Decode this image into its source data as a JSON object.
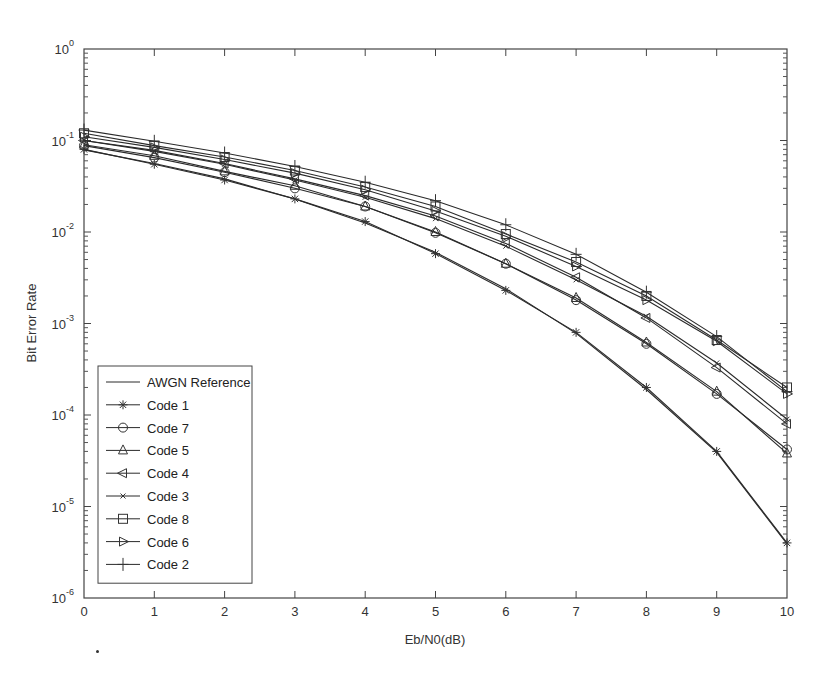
{
  "chart_data": {
    "type": "line",
    "title": "",
    "xlabel": "Eb/N0(dB)",
    "ylabel": "Bit Error Rate",
    "xlim": [
      0,
      10
    ],
    "ylim": [
      1e-06,
      1
    ],
    "yscale": "log",
    "grid": false,
    "legend_position": "lower left",
    "x_ticks": [
      "0",
      "1",
      "2",
      "3",
      "4",
      "5",
      "6",
      "7",
      "8",
      "9",
      "10"
    ],
    "y_ticks": [
      {
        "base": "10",
        "exp": "0"
      },
      {
        "base": "10",
        "exp": "-1"
      },
      {
        "base": "10",
        "exp": "-2"
      },
      {
        "base": "10",
        "exp": "-3"
      },
      {
        "base": "10",
        "exp": "-4"
      },
      {
        "base": "10",
        "exp": "-5"
      },
      {
        "base": "10",
        "exp": "-6"
      }
    ],
    "x": [
      0,
      1,
      2,
      3,
      4,
      5,
      6,
      7,
      8,
      9,
      10
    ],
    "series": [
      {
        "name": "AWGN Reference",
        "marker": "none",
        "values": [
          0.079,
          0.056,
          0.038,
          0.023,
          0.0125,
          0.006,
          0.0024,
          0.00078,
          0.00019,
          3.9e-05,
          3.9e-06
        ]
      },
      {
        "name": "Code 1",
        "marker": "asterisk",
        "values": [
          0.08,
          0.055,
          0.037,
          0.023,
          0.013,
          0.0058,
          0.0023,
          0.0008,
          0.0002,
          4e-05,
          4e-06
        ]
      },
      {
        "name": "Code 7",
        "marker": "circle",
        "values": [
          0.088,
          0.065,
          0.045,
          0.03,
          0.019,
          0.0098,
          0.0045,
          0.0018,
          0.0006,
          0.00017,
          4.2e-05
        ]
      },
      {
        "name": "Code 5",
        "marker": "triangle-up",
        "values": [
          0.09,
          0.068,
          0.046,
          0.032,
          0.019,
          0.01,
          0.0045,
          0.0019,
          0.00062,
          0.00018,
          3.8e-05
        ]
      },
      {
        "name": "Code 4",
        "marker": "triangle-left",
        "values": [
          0.1,
          0.078,
          0.056,
          0.038,
          0.025,
          0.015,
          0.0075,
          0.0032,
          0.00115,
          0.00033,
          8e-05
        ]
      },
      {
        "name": "Code 3",
        "marker": "x-small",
        "values": [
          0.1,
          0.076,
          0.055,
          0.037,
          0.024,
          0.014,
          0.007,
          0.003,
          0.0012,
          0.00037,
          9e-05
        ]
      },
      {
        "name": "Code 8",
        "marker": "square",
        "values": [
          0.12,
          0.088,
          0.066,
          0.047,
          0.031,
          0.019,
          0.0095,
          0.0047,
          0.002,
          0.00066,
          0.0002
        ]
      },
      {
        "name": "Code 6",
        "marker": "triangle-right",
        "values": [
          0.11,
          0.084,
          0.062,
          0.044,
          0.029,
          0.017,
          0.009,
          0.0042,
          0.0018,
          0.00064,
          0.00017
        ]
      },
      {
        "name": "Code 2",
        "marker": "plus",
        "values": [
          0.13,
          0.098,
          0.073,
          0.052,
          0.035,
          0.022,
          0.012,
          0.0057,
          0.0022,
          0.00072,
          0.00018
        ]
      }
    ]
  },
  "footnote_mark": "."
}
